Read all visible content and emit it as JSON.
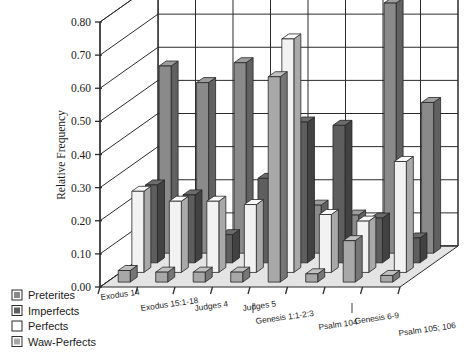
{
  "chart_data": {
    "type": "bar",
    "title": "",
    "xlabel": "",
    "ylabel": "Relative Frequency",
    "ylim": [
      0.0,
      0.8
    ],
    "ytick_labels": [
      "0.00",
      "0.10",
      "0.20",
      "0.30",
      "0.40",
      "0.50",
      "0.60",
      "0.70",
      "0.80"
    ],
    "ytick_values": [
      0.0,
      0.1,
      0.2,
      0.3,
      0.4,
      0.5,
      0.6,
      0.7,
      0.8
    ],
    "grid": true,
    "legend_position": "bottom-left",
    "projection": "3d",
    "categories": [
      "Exodus 14",
      "Exodus 15:1-18",
      "Judges 4",
      "Judges 5",
      "Genesis 1:1-2:3",
      "Psalm 104",
      "Genesis 6-9",
      "Psalm 105; 106"
    ],
    "series": [
      {
        "name": "Preterites",
        "color": "#8a8a8a",
        "values": [
          0.565,
          0.515,
          0.575,
          0.055,
          0.145,
          0.115,
          0.755,
          0.455
        ]
      },
      {
        "name": "Imperfects",
        "color": "#5e5e5e",
        "values": [
          0.235,
          0.205,
          0.085,
          0.255,
          0.425,
          0.415,
          0.135,
          0.075
        ]
      },
      {
        "name": "Perfects",
        "color": "#f2f2f2",
        "values": [
          0.245,
          0.215,
          0.215,
          0.205,
          0.705,
          0.175,
          0.155,
          0.335
        ]
      },
      {
        "name": "Waw-Perfects",
        "color": "#a8a8a8",
        "values": [
          0.035,
          0.03,
          0.03,
          0.03,
          0.62,
          0.025,
          0.125,
          0.02
        ]
      }
    ]
  },
  "legend": {
    "items": [
      {
        "label": "Preterites",
        "color": "#8a8a8a"
      },
      {
        "label": "Imperfects",
        "color": "#5e5e5e"
      },
      {
        "label": "Perfects",
        "color": "#f2f2f2"
      },
      {
        "label": "Waw-Perfects",
        "color": "#a8a8a8"
      }
    ]
  }
}
